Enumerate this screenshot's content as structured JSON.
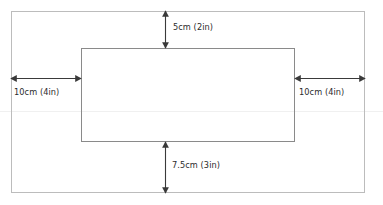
{
  "diagram": {
    "type": "page-margin-dimension-diagram",
    "background_color": "#ffffff",
    "outer_rect": {
      "name": "page-boundary",
      "x": 11,
      "y": 11,
      "width": 354,
      "height": 182,
      "stroke_color": "#bcbcbc"
    },
    "inner_rect": {
      "name": "content-block",
      "x": 81,
      "y": 48,
      "width": 214,
      "height": 94,
      "stroke_color": "#8a8a8a"
    },
    "artifact_line_y": 111,
    "arrow_color": "#3a3a3a",
    "label_color": "#2b2b2b",
    "dimensions": [
      {
        "id": "top-margin",
        "label": "5cm (2in)",
        "orientation": "vertical",
        "value_cm": 5,
        "value_in": 2,
        "arrow": {
          "x": 165,
          "y1": 11,
          "y2": 48
        },
        "label_pos": {
          "x": 173,
          "y": 23
        }
      },
      {
        "id": "bottom-margin",
        "label": "7.5cm (3in)",
        "orientation": "vertical",
        "value_cm": 7.5,
        "value_in": 3,
        "arrow": {
          "x": 165,
          "y1": 142,
          "y2": 193
        },
        "label_pos": {
          "x": 172,
          "y": 161
        }
      },
      {
        "id": "left-margin",
        "label": "10cm (4in)",
        "orientation": "horizontal",
        "value_cm": 10,
        "value_in": 4,
        "arrow": {
          "y": 78,
          "x1": 11,
          "x2": 81
        },
        "label_pos": {
          "x": 14,
          "y": 88
        }
      },
      {
        "id": "right-margin",
        "label": "10cm (4in)",
        "orientation": "horizontal",
        "value_cm": 10,
        "value_in": 4,
        "arrow": {
          "y": 78,
          "x1": 295,
          "x2": 365
        },
        "label_pos": {
          "x": 299,
          "y": 88
        }
      }
    ]
  }
}
